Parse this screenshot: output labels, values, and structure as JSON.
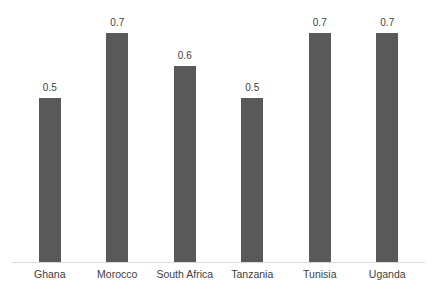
{
  "chart_data": {
    "type": "bar",
    "title": "",
    "xlabel": "",
    "ylabel": "",
    "categories": [
      "Ghana",
      "Morocco",
      "South Africa",
      "Tanzania",
      "Tunisia",
      "Uganda"
    ],
    "values": [
      0.5,
      0.7,
      0.6,
      0.5,
      0.7,
      0.7
    ],
    "value_labels": [
      "0.5",
      "0.7",
      "0.6",
      "0.5",
      "0.7",
      "0.7"
    ],
    "ylim": [
      0,
      0.8
    ],
    "grid": false,
    "legend": "none",
    "data_labels_position": "above-bars",
    "bar_color": "#595959",
    "axis_line_color": "#d9d9d9",
    "label_color": "#404040",
    "background_color": "#ffffff"
  }
}
